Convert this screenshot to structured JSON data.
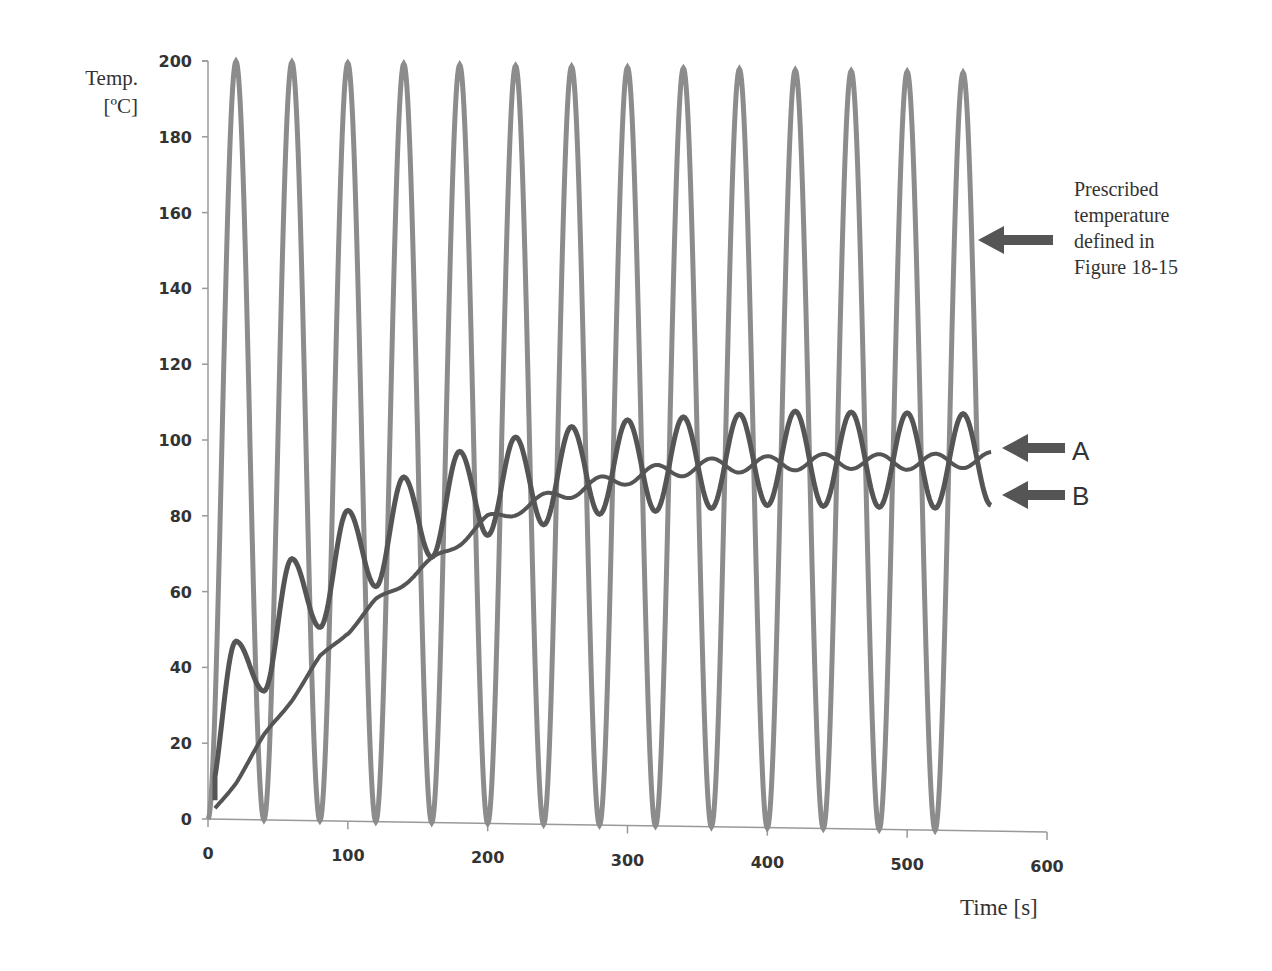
{
  "chart_data": {
    "type": "line",
    "title": "",
    "xlabel": "Time [s]",
    "ylabel": "Temp. [ºC]",
    "xlim": [
      0,
      600
    ],
    "ylim": [
      0,
      200
    ],
    "x_ticks": [
      "0",
      "100",
      "200",
      "300",
      "400",
      "500",
      "600"
    ],
    "y_ticks": [
      "0",
      "20",
      "40",
      "60",
      "80",
      "100",
      "120",
      "140",
      "160",
      "180",
      "200"
    ],
    "grid": false,
    "series": [
      {
        "name": "Prescribed temperature",
        "description": "oscillates 0–200 ºC, period ~40 s",
        "amplitude": 100,
        "mean": 100,
        "period_s": 40,
        "t_range": [
          0,
          560
        ]
      },
      {
        "name": "A",
        "description": "slow response rising to ~97 ºC with small oscillation",
        "x": [
          0,
          20,
          40,
          60,
          80,
          100,
          120,
          150,
          200,
          250,
          300,
          350,
          400,
          450,
          500,
          560
        ],
        "y": [
          0,
          10,
          22,
          32,
          43,
          50,
          58,
          66,
          80,
          87,
          92,
          95,
          96,
          97,
          97,
          98
        ]
      },
      {
        "name": "B",
        "description": "faster response oscillating, peaks rising to ~110 ºC, troughs ~85 ºC",
        "peaks_x": [
          20,
          60,
          100,
          140,
          180,
          220,
          260,
          300,
          340,
          380,
          420,
          460,
          500,
          540
        ],
        "peaks_y": [
          47,
          69,
          82,
          91,
          98,
          102,
          105,
          107,
          108,
          109,
          110,
          110,
          110,
          110
        ],
        "troughs_x": [
          0,
          40,
          80,
          120,
          160,
          200,
          240,
          280,
          320,
          360,
          400,
          440,
          480,
          520,
          560
        ],
        "troughs_y": [
          5,
          34,
          51,
          62,
          70,
          76,
          79,
          82,
          83,
          84,
          85,
          85,
          85,
          85,
          86
        ]
      }
    ],
    "annotations": [
      {
        "text": "Prescribed temperature defined in Figure 18-15",
        "target": "Prescribed temperature"
      },
      {
        "text": "A",
        "target": "A"
      },
      {
        "text": "B",
        "target": "B"
      }
    ]
  },
  "labels": {
    "ylabel_line1": "Temp.",
    "ylabel_line2": "[ºC]",
    "xlabel": "Time [s]",
    "note_lines": [
      "Prescribed",
      "temperature",
      "defined in",
      "Figure 18-15"
    ],
    "label_a": "A",
    "label_b": "B"
  },
  "colors": {
    "prescribed": "#8c8c8c",
    "response": "#555555",
    "axis": "#999999",
    "text": "#333333"
  }
}
